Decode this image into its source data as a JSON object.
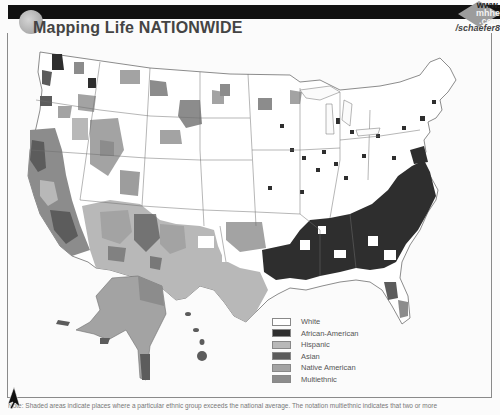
{
  "header": {
    "title": "Mapping Life NATIONWIDE",
    "watermark_line1": "www.",
    "watermark_line2": "mhhe",
    "watermark_line3": ".com",
    "watermark_path": "/schaefer8"
  },
  "map": {
    "subject": "Ethnic group concentrations by county, United States",
    "regions": [
      "Contiguous United States",
      "Alaska",
      "Hawaii"
    ],
    "colors": {
      "background": "#fbfbfb",
      "state_border": "#6e6e6e",
      "white": "#ffffff",
      "african_american": "#2e2e2e",
      "hispanic": "#b8b8b8",
      "asian": "#5c5c5c",
      "native_american": "#a3a3a3",
      "multiethnic": "#8c8c8c"
    }
  },
  "legend": {
    "items": [
      {
        "label": "White",
        "color": "#ffffff"
      },
      {
        "label": "African-American",
        "color": "#2e2e2e"
      },
      {
        "label": "Hispanic",
        "color": "#b8b8b8"
      },
      {
        "label": "Asian",
        "color": "#5c5c5c"
      },
      {
        "label": "Native American",
        "color": "#a3a3a3"
      },
      {
        "label": "Multiethnic",
        "color": "#8c8c8c"
      }
    ]
  },
  "footnote": {
    "text": "Note: Shaded areas indicate places where a particular ethnic group exceeds the national average. The notation multiethnic indicates that two or more"
  }
}
